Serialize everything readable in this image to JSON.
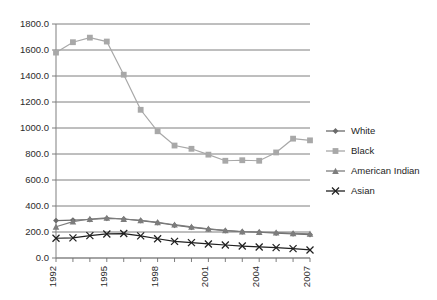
{
  "chart_data": {
    "type": "line",
    "title": "",
    "subtitle": "",
    "xlabel": "",
    "ylabel": "",
    "grid": "horizontal",
    "legend_position": "right",
    "x": [
      1992,
      1993,
      1994,
      1995,
      1996,
      1997,
      1998,
      1999,
      2000,
      2001,
      2002,
      2003,
      2004,
      2005,
      2006,
      2007
    ],
    "xlim": [
      1992,
      2007
    ],
    "ylim": [
      0.0,
      1800.0
    ],
    "yticks": [
      0.0,
      200.0,
      400.0,
      600.0,
      800.0,
      1000.0,
      1200.0,
      1400.0,
      1600.0,
      1800.0
    ],
    "ytick_labels": [
      "0.0",
      "200.0",
      "400.0",
      "600.0",
      "800.0",
      "1000.0",
      "1200.0",
      "1400.0",
      "1600.0",
      "1800.0"
    ],
    "xtick_labels": [
      "1992",
      "",
      "",
      "1995",
      "",
      "",
      "1998",
      "",
      "",
      "2001",
      "",
      "",
      "2004",
      "",
      "",
      "2007"
    ],
    "series": [
      {
        "name": "White",
        "marker": "diamond",
        "color": "#6b6b6b",
        "values": [
          288,
          292,
          296,
          305,
          300,
          288,
          272,
          252,
          236,
          222,
          210,
          202,
          198,
          192,
          186,
          180
        ]
      },
      {
        "name": "Black",
        "marker": "square",
        "color": "#a8a8a8",
        "values": [
          1580,
          1660,
          1695,
          1665,
          1410,
          1140,
          975,
          865,
          840,
          795,
          748,
          752,
          748,
          812,
          918,
          905
        ]
      },
      {
        "name": "American Indian",
        "marker": "triangle",
        "color": "#7d7d7d",
        "values": [
          240,
          280,
          300,
          308,
          300,
          290,
          275,
          256,
          240,
          225,
          212,
          204,
          200,
          196,
          190,
          186
        ]
      },
      {
        "name": "Asian",
        "marker": "x",
        "color": "#202020",
        "values": [
          152,
          155,
          172,
          185,
          188,
          170,
          148,
          128,
          118,
          108,
          100,
          92,
          85,
          80,
          72,
          62
        ]
      }
    ]
  },
  "legend": {
    "entries": [
      {
        "label": "White"
      },
      {
        "label": "Black"
      },
      {
        "label": "American Indian"
      },
      {
        "label": "Asian"
      }
    ]
  }
}
